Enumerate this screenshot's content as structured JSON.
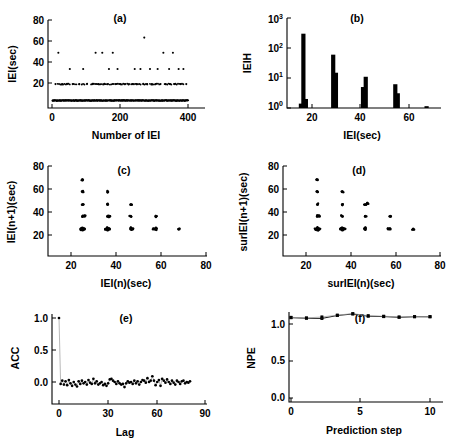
{
  "figure": {
    "panel_count": 6,
    "background": "#ffffff",
    "foreground": "#000000"
  },
  "chart_data": [
    {
      "id": "a",
      "type": "scatter",
      "title": "(a)",
      "xlabel": "Number of IEI",
      "ylabel": "IEI(sec)",
      "xlim": [
        0,
        440
      ],
      "ylim": [
        10,
        80
      ],
      "xticks": [
        0,
        200,
        400
      ],
      "yticks": [
        20,
        40,
        60,
        80
      ],
      "grid": false,
      "description": "Inter-event interval series showing quantized bands",
      "bands": [
        16,
        29,
        41,
        54,
        66
      ],
      "x": [
        2,
        5,
        8,
        11,
        14,
        17,
        20,
        23,
        26,
        29,
        32,
        35,
        38,
        41,
        44,
        47,
        50,
        53,
        56,
        59,
        62,
        65,
        68,
        71,
        74,
        77,
        80,
        83,
        86,
        89,
        92,
        95,
        98,
        101,
        104,
        107,
        110,
        113,
        116,
        119,
        122,
        125,
        128,
        131,
        134,
        137,
        140,
        143,
        146,
        149,
        152,
        155,
        158,
        161,
        164,
        167,
        170,
        173,
        176,
        179,
        182,
        185,
        188,
        191,
        194,
        197,
        200,
        203,
        206,
        209,
        212,
        215,
        218,
        221,
        224,
        227,
        230,
        233,
        236,
        239,
        242,
        245,
        248,
        251,
        254,
        257,
        260,
        263,
        266,
        269,
        272,
        275,
        278,
        281,
        284,
        287,
        290,
        293,
        296,
        299,
        302,
        305,
        308,
        311,
        314,
        317,
        320,
        323,
        326,
        329,
        332,
        335,
        338,
        341,
        344,
        347,
        350,
        353,
        356,
        359,
        362,
        365,
        368,
        371,
        374,
        377,
        380,
        383,
        386,
        389,
        392,
        395,
        398,
        401,
        404,
        407,
        410,
        413,
        416,
        419,
        422,
        425
      ],
      "y": [
        16,
        16,
        16,
        29,
        16,
        16,
        54,
        16,
        16,
        16,
        29,
        16,
        16,
        16,
        16,
        29,
        16,
        16,
        41,
        16,
        16,
        29,
        16,
        16,
        16,
        16,
        16,
        16,
        29,
        16,
        16,
        16,
        41,
        16,
        16,
        16,
        29,
        16,
        16,
        16,
        16,
        16,
        29,
        16,
        16,
        54,
        16,
        16,
        29,
        16,
        16,
        16,
        54,
        16,
        29,
        16,
        16,
        16,
        29,
        41,
        16,
        16,
        16,
        54,
        16,
        16,
        29,
        16,
        41,
        16,
        16,
        29,
        16,
        16,
        16,
        16,
        29,
        16,
        16,
        16,
        29,
        16,
        16,
        16,
        29,
        16,
        41,
        16,
        29,
        16,
        16,
        16,
        41,
        16,
        16,
        29,
        66,
        16,
        16,
        29,
        16,
        16,
        41,
        16,
        29,
        16,
        16,
        16,
        29,
        16,
        41,
        16,
        16,
        29,
        16,
        16,
        54,
        16,
        29,
        16,
        16,
        16,
        41,
        29,
        16,
        16,
        54,
        16,
        29,
        16,
        16,
        16,
        41,
        16,
        29,
        16,
        16,
        41,
        16,
        16,
        29,
        16,
        16,
        41,
        16,
        29,
        16,
        29
      ]
    },
    {
      "id": "b",
      "type": "bar",
      "title": "(b)",
      "xlabel": "IEI(sec)",
      "ylabel": "IEIH",
      "xlim": [
        10,
        72
      ],
      "ylim": [
        1,
        1000
      ],
      "yscale": "log",
      "xticks": [
        20,
        40,
        60
      ],
      "ytick_labels": [
        "10 0",
        "10 1",
        "10 2",
        "10 3"
      ],
      "ytick_mantissa": [
        "10",
        "10",
        "10",
        "10"
      ],
      "ytick_exponents": [
        "0",
        "1",
        "2",
        "3"
      ],
      "grid": false,
      "description": "Histogram of IEI values on logarithmic count axis; paired bars per mode",
      "bars": [
        {
          "x": 15.6,
          "value": 1.4
        },
        {
          "x": 16.6,
          "value": 300
        },
        {
          "x": 17.6,
          "value": 2.0
        },
        {
          "x": 28.6,
          "value": 60
        },
        {
          "x": 29.7,
          "value": 15
        },
        {
          "x": 40.6,
          "value": 5.0
        },
        {
          "x": 41.7,
          "value": 11
        },
        {
          "x": 53.6,
          "value": 6.2
        },
        {
          "x": 54.6,
          "value": 3.1
        },
        {
          "x": 66.2,
          "value": 1.15
        }
      ]
    },
    {
      "id": "c",
      "type": "scatter",
      "title": "(c)",
      "xlabel": "IEI(n)(sec)",
      "ylabel": "IEI(n+1)(sec)",
      "xlim": [
        10,
        80
      ],
      "ylim": [
        10,
        80
      ],
      "xticks": [
        20,
        40,
        60,
        80
      ],
      "yticks": [
        20,
        40,
        60,
        80
      ],
      "grid": false,
      "description": "Return map of successive IEI values, lattice of discrete modes",
      "points": [
        [
          16,
          16
        ],
        [
          16,
          17
        ],
        [
          17,
          16
        ],
        [
          16,
          29
        ],
        [
          16,
          41
        ],
        [
          16,
          54
        ],
        [
          16,
          66
        ],
        [
          17,
          29
        ],
        [
          15,
          16
        ],
        [
          16,
          15
        ],
        [
          29,
          16
        ],
        [
          29,
          17
        ],
        [
          30,
          16
        ],
        [
          29,
          29
        ],
        [
          29,
          41
        ],
        [
          29,
          54
        ],
        [
          28,
          16
        ],
        [
          29,
          15
        ],
        [
          30,
          29
        ],
        [
          41,
          16
        ],
        [
          41,
          29
        ],
        [
          41,
          41
        ],
        [
          42,
          16
        ],
        [
          41,
          17
        ],
        [
          54,
          16
        ],
        [
          54,
          29
        ],
        [
          54,
          17
        ],
        [
          53,
          16
        ],
        [
          66,
          16
        ]
      ]
    },
    {
      "id": "d",
      "type": "scatter",
      "title": "(d)",
      "xlabel": "surIEI(n)(sec)",
      "ylabel": "surIEI(n+1)(sec)",
      "xlim": [
        10,
        80
      ],
      "ylim": [
        10,
        80
      ],
      "xticks": [
        20,
        40,
        60,
        80
      ],
      "yticks": [
        20,
        40,
        60,
        80
      ],
      "grid": false,
      "description": "Return map of surrogate IEI data, same lattice structure",
      "points": [
        [
          16,
          16
        ],
        [
          16,
          17
        ],
        [
          17,
          16
        ],
        [
          16,
          29
        ],
        [
          16,
          41
        ],
        [
          16,
          54
        ],
        [
          16,
          66
        ],
        [
          17,
          29
        ],
        [
          15,
          16
        ],
        [
          16,
          15
        ],
        [
          29,
          16
        ],
        [
          29,
          17
        ],
        [
          30,
          16
        ],
        [
          29,
          29
        ],
        [
          29,
          41
        ],
        [
          29,
          54
        ],
        [
          28,
          16
        ],
        [
          29,
          15
        ],
        [
          41,
          16
        ],
        [
          41,
          29
        ],
        [
          41,
          41
        ],
        [
          42,
          42
        ],
        [
          41,
          17
        ],
        [
          54,
          16
        ],
        [
          54,
          29
        ],
        [
          53,
          16
        ],
        [
          66,
          16
        ]
      ]
    },
    {
      "id": "e",
      "type": "line",
      "title": "(e)",
      "xlabel": "Lag",
      "ylabel": "ACC",
      "xlim": [
        -2,
        90
      ],
      "ylim": [
        -0.18,
        1.08
      ],
      "xticks": [
        0,
        30,
        60,
        90
      ],
      "yticks": [
        0.0,
        0.5,
        1.0
      ],
      "ytick_labels": [
        "0.0",
        "0.5",
        "1.0"
      ],
      "grid": false,
      "description": "Autocorrelation function; unity spike at lag 0 then noise about zero",
      "x": [
        0,
        1,
        2,
        3,
        4,
        5,
        6,
        7,
        8,
        9,
        10,
        11,
        12,
        13,
        14,
        15,
        16,
        17,
        18,
        19,
        20,
        21,
        22,
        23,
        24,
        25,
        26,
        27,
        28,
        29,
        30,
        31,
        32,
        33,
        34,
        35,
        36,
        37,
        38,
        39,
        40,
        41,
        42,
        43,
        44,
        45,
        46,
        47,
        48,
        49,
        50,
        51,
        52,
        53,
        54,
        55,
        56,
        57,
        58,
        59,
        60,
        61,
        62,
        63,
        64,
        65,
        66,
        67,
        68,
        69,
        70,
        71,
        72,
        73,
        74,
        75,
        76,
        77,
        78,
        79,
        80
      ],
      "y": [
        1.0,
        -0.03,
        0.02,
        -0.04,
        0.01,
        -0.05,
        0.03,
        -0.02,
        -0.06,
        0.0,
        -0.04,
        -0.07,
        0.01,
        -0.03,
        0.02,
        -0.02,
        0.0,
        -0.04,
        0.03,
        -0.01,
        -0.03,
        0.05,
        -0.02,
        0.01,
        -0.04,
        -0.02,
        0.0,
        -0.05,
        -0.03,
        -0.06,
        -0.02,
        0.04,
        0.05,
        0.02,
        0.0,
        -0.03,
        0.01,
        -0.02,
        -0.04,
        -0.03,
        -0.08,
        -0.02,
        0.01,
        -0.01,
        0.0,
        -0.03,
        0.02,
        -0.02,
        0.01,
        -0.04,
        0.0,
        0.03,
        0.02,
        -0.01,
        0.06,
        0.0,
        0.02,
        0.09,
        0.02,
        -0.05,
        0.0,
        0.03,
        -0.06,
        0.05,
        0.02,
        -0.01,
        0.04,
        0.0,
        -0.03,
        0.02,
        -0.01,
        -0.04,
        0.02,
        0.0,
        -0.03,
        0.01,
        0.02,
        -0.02,
        0.0,
        -0.01,
        0.01
      ]
    },
    {
      "id": "f",
      "type": "line",
      "title": "(f)",
      "xlabel": "Prediction step",
      "ylabel": "NPE",
      "xlim": [
        0,
        11
      ],
      "ylim": [
        0.0,
        1.25
      ],
      "xticks": [
        0,
        5,
        10
      ],
      "yticks": [
        0.0,
        0.5,
        1.0
      ],
      "ytick_labels": [
        "0.0",
        "0.5",
        "1.0"
      ],
      "grid": false,
      "description": "Normalized prediction error versus prediction step for original and surrogate data",
      "x": [
        1,
        2,
        3,
        4,
        5,
        6,
        7,
        8,
        9,
        10
      ],
      "series": [
        {
          "name": "original",
          "values": [
            1.085,
            1.078,
            1.075,
            1.115,
            1.135,
            1.105,
            1.1,
            1.09,
            1.098,
            1.097
          ],
          "marker": "square"
        },
        {
          "name": "surrogate",
          "values": [
            1.09,
            1.082,
            1.095,
            1.12,
            1.14,
            1.112,
            1.105,
            1.095,
            1.1,
            1.1
          ],
          "marker": "square",
          "errorbars": [
            0.018,
            0.014,
            0.022,
            0.018,
            0.016,
            0.02,
            0.015,
            0.018,
            0.012,
            0.014
          ]
        }
      ]
    }
  ]
}
